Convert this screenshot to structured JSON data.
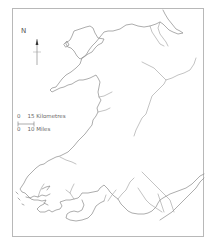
{
  "map": {
    "title": "",
    "region": "Wales",
    "colors": {
      "background": "#ffffff",
      "coastline": "#8a8a8a",
      "rivers": "#9a9a9a",
      "frame": "#b8b8b8",
      "text": "#555555"
    }
  },
  "north_arrow": {
    "label": "N",
    "icon": "north-arrow-icon"
  },
  "scale_bar": {
    "km_start": "0",
    "km_label": "15 Kilometres",
    "mi_start": "0",
    "mi_label": "10 Miles"
  }
}
